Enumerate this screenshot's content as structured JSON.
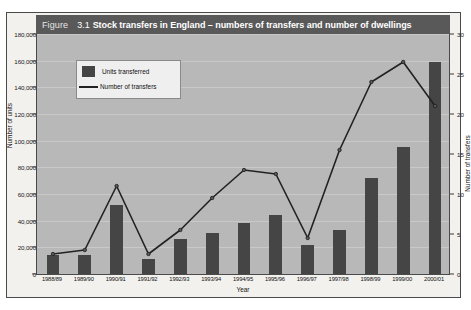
{
  "figure": {
    "label_word": "Figure",
    "number": "3.1",
    "title": "Stock transfers in England – numbers of transfers and number of dwellings"
  },
  "legend": {
    "bar_label": "Units transferred",
    "line_label": "Number of transfers"
  },
  "axes": {
    "y_left_title": "Number of units",
    "y_right_title": "Number of transfers",
    "x_title": "Year"
  },
  "chart_data": {
    "type": "bar",
    "title": "Figure 3.1 Stock transfers in England – numbers of transfers and number of dwellings",
    "xlabel": "Year",
    "ylabel": "Number of units",
    "y2label": "Number of transfers",
    "ylim": [
      0,
      180000
    ],
    "y2lim": [
      0,
      30
    ],
    "yticks": [
      0,
      20000,
      40000,
      60000,
      80000,
      100000,
      120000,
      140000,
      160000,
      180000
    ],
    "ytick_labels": [
      "0",
      "20,000",
      "40,000",
      "60,000",
      "80,000",
      "100,000",
      "120,000",
      "140,000",
      "160,000",
      "180,000"
    ],
    "y2ticks": [
      0,
      5,
      10,
      15,
      20,
      25,
      30
    ],
    "y2tick_labels": [
      "0",
      "5",
      "10",
      "15",
      "20",
      "25",
      "30"
    ],
    "grid": true,
    "legend_position": "upper-left",
    "categories": [
      "1988/89",
      "1989/90",
      "1990/91",
      "1991/92",
      "1992/93",
      "1993/94",
      "1994/95",
      "1995/96",
      "1996/97",
      "1997/98",
      "1998/99",
      "1999/00",
      "2000/01"
    ],
    "series": [
      {
        "name": "Units transferred",
        "type": "bar",
        "axis": "left",
        "color": "#454545",
        "values": [
          14000,
          14500,
          52000,
          11000,
          26000,
          31000,
          38000,
          44000,
          22000,
          33000,
          72000,
          95000,
          159000
        ]
      },
      {
        "name": "Number of transfers",
        "type": "line",
        "axis": "right",
        "color": "#222222",
        "values": [
          2.5,
          3,
          11,
          2.5,
          5.5,
          9.5,
          13,
          12.5,
          4.5,
          15.5,
          24,
          26.5,
          21
        ]
      }
    ]
  }
}
